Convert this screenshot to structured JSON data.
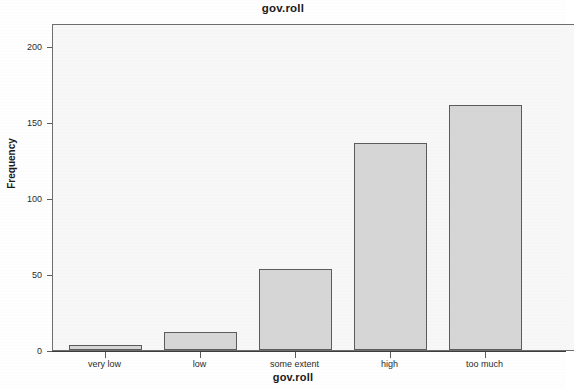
{
  "chart_data": {
    "type": "bar",
    "title": "gov.roll",
    "xlabel": "gov.roll",
    "ylabel": "Frequency",
    "categories": [
      "very low",
      "low",
      "some extent",
      "high",
      "too much"
    ],
    "values": [
      3,
      12,
      53,
      136,
      161
    ],
    "ylim": [
      0,
      215
    ],
    "yticks": [
      0,
      50,
      100,
      150,
      200
    ],
    "ytick_labels": [
      "0",
      "50",
      "100",
      "150",
      "200"
    ],
    "grid": false,
    "legend": null,
    "bar_fill_color": "#d6d6d6",
    "bar_edge_color": "#5c5c5c",
    "plot_background_color": "#f7f7f7",
    "axis_color": "#5c5c5c",
    "text_color": "#1a1a1a"
  }
}
